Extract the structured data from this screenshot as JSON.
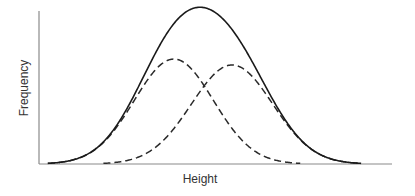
{
  "chart_data": {
    "type": "line",
    "title": "",
    "xlabel": "Height",
    "ylabel": "Frequency",
    "xlim": [
      0,
      100
    ],
    "ylim": [
      0,
      1
    ],
    "grid": false,
    "legend": "none",
    "x_ticks": [],
    "y_ticks": [],
    "series": [
      {
        "name": "Component A",
        "style": "dashed",
        "distribution": "normal",
        "mean": 38.2,
        "sd": 11.2,
        "peak": 0.686
      },
      {
        "name": "Component B",
        "style": "dashed",
        "distribution": "normal",
        "mean": 54.7,
        "sd": 11.5,
        "peak": 0.647
      },
      {
        "name": "Combined",
        "style": "solid",
        "distribution": "sum",
        "components": [
          "Component A",
          "Component B"
        ]
      }
    ]
  }
}
